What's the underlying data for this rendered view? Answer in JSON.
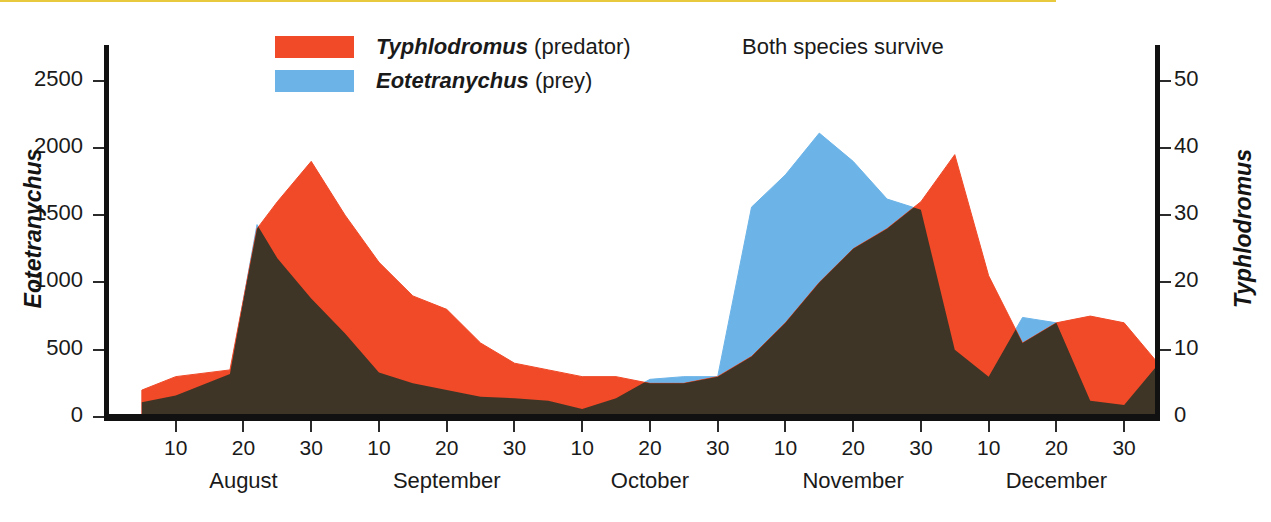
{
  "chart_data": {
    "type": "area",
    "title": "Both species survive",
    "xlabel": "",
    "ylabel": "Eotetranychus",
    "y2label": "Typhlodromus",
    "ylim": [
      0,
      2750
    ],
    "y2lim": [
      0,
      55
    ],
    "grid": false,
    "legend_position": "top-left",
    "y_ticks": [
      0,
      500,
      1000,
      1500,
      2000,
      2500
    ],
    "y_tick_labels": [
      "0",
      "500",
      "1000",
      "1500",
      "2000",
      "2500"
    ],
    "y2_ticks": [
      0,
      10,
      20,
      30,
      40,
      50
    ],
    "y2_tick_labels": [
      "0",
      "10",
      "20",
      "30",
      "40",
      "50"
    ],
    "x_months": [
      "August",
      "September",
      "October",
      "November",
      "December"
    ],
    "x_day_ticks": [
      "10",
      "20",
      "30",
      "10",
      "20",
      "30",
      "10",
      "20",
      "30",
      "10",
      "20",
      "30",
      "10",
      "20",
      "30"
    ],
    "x_first_tick_day": 10,
    "x_tick_step_days": 10,
    "series": [
      {
        "name": "Typhlodromus (predator)",
        "short_name": "Typhlodromus",
        "qualifier": "(predator)",
        "color": "#F04A28",
        "axis": "right",
        "units_right_axis": true,
        "x_days": [
          5,
          10,
          18,
          22,
          25,
          30,
          35,
          40,
          45,
          50,
          55,
          60,
          65,
          70,
          75,
          80,
          85,
          90,
          95,
          100,
          105,
          110,
          115,
          120,
          125,
          130,
          135,
          140,
          145,
          150,
          155
        ],
        "values": [
          4,
          6,
          7,
          28,
          32,
          38,
          30,
          23,
          18,
          16,
          11,
          8,
          7,
          6,
          6,
          5,
          5,
          6,
          9,
          14,
          20,
          25,
          28,
          32,
          39,
          21,
          11,
          14,
          15,
          14,
          8
        ]
      },
      {
        "name": "Eotetranychus (prey)",
        "short_name": "Eotetranychus",
        "qualifier": "(prey)",
        "color": "#6CB4E8",
        "axis": "left",
        "x_days": [
          5,
          10,
          18,
          22,
          25,
          30,
          35,
          40,
          45,
          50,
          55,
          60,
          65,
          70,
          75,
          80,
          85,
          90,
          95,
          100,
          105,
          110,
          115,
          120,
          125,
          130,
          135,
          140,
          145,
          150,
          155
        ],
        "values": [
          110,
          160,
          320,
          1430,
          1180,
          880,
          620,
          330,
          250,
          200,
          150,
          140,
          120,
          60,
          140,
          280,
          300,
          300,
          1560,
          1800,
          2110,
          1900,
          1620,
          1540,
          500,
          300,
          740,
          700,
          120,
          90,
          390
        ]
      }
    ],
    "overlap_fill_color": "#3E3526"
  },
  "axes": {
    "left_title": "Eotetranychus",
    "right_title": "Typhlodromus"
  },
  "legend": {
    "items": [
      {
        "species": "Typhlodromus",
        "qualifier": "(predator)",
        "color": "#F04A28"
      },
      {
        "species": "Eotetranychus",
        "qualifier": "(prey)",
        "color": "#6CB4E8"
      }
    ]
  },
  "annotation": {
    "text": "Both species survive"
  }
}
